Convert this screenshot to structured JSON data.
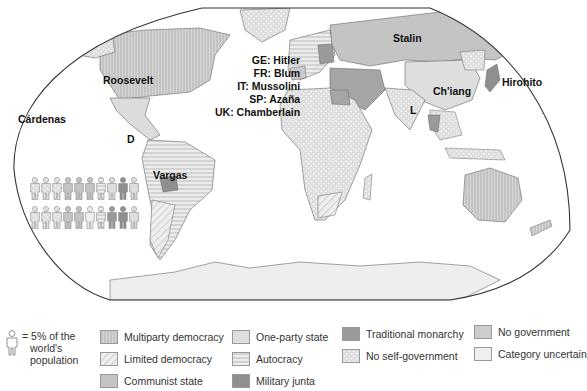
{
  "map": {
    "title": "World political systems (c. 1936)",
    "frame_shape": "robinson-like rounded projection",
    "leaders": [
      {
        "id": "us",
        "label": "Roosevelt",
        "x": 103,
        "y": 75
      },
      {
        "id": "mexico",
        "label": "Cárdenas",
        "x": 18,
        "y": 114
      },
      {
        "id": "mexico-abbr",
        "label": "D",
        "x": 128,
        "y": 116
      },
      {
        "id": "brazil",
        "label": "Vargas",
        "x": 153,
        "y": 170
      },
      {
        "id": "ussr",
        "label": "Stalin",
        "x": 393,
        "y": 33
      },
      {
        "id": "china",
        "label": "Ch'iang",
        "x": 433,
        "y": 86
      },
      {
        "id": "india",
        "label": "L",
        "x": 409,
        "y": 107
      },
      {
        "id": "japan",
        "label": "Hirohito",
        "x": 502,
        "y": 77
      }
    ],
    "europe_leaders": [
      "GE: Hitler",
      "FR: Blum",
      "IT: Mussolini",
      "SP: Azaña",
      "UK: Chamberlain"
    ]
  },
  "population_pictogram": {
    "unit_label": "= 5% of the world's population",
    "unit_lines": [
      "= 5% of the",
      "world's",
      "population"
    ],
    "rows": [
      [
        "no-self-government",
        "no-self-government",
        "no-self-government",
        "communist-state",
        "communist-state",
        "communist-state",
        "autocracy",
        "one-party-state",
        "military-junta",
        "one-party-state"
      ],
      [
        "no-self-government",
        "no-self-government",
        "no-self-government",
        "communist-state",
        "communist-state",
        "category-uncertain",
        "autocracy",
        "traditional-monarchy",
        "military-junta",
        "one-party-state"
      ]
    ]
  },
  "legend": {
    "items": [
      {
        "key": "multiparty-democracy",
        "label": "Multiparty democracy",
        "fill": "#d2d2d2",
        "pattern": "vertical-lines"
      },
      {
        "key": "limited-democracy",
        "label": "Limited democracy",
        "fill": "#ececec",
        "pattern": "diagonal-lines"
      },
      {
        "key": "communist-state",
        "label": "Communist state",
        "fill": "#c4c4c4",
        "pattern": "solid"
      },
      {
        "key": "one-party-state",
        "label": "One-party state",
        "fill": "#dedede",
        "pattern": "solid"
      },
      {
        "key": "autocracy",
        "label": "Autocracy",
        "fill": "#e6e6e6",
        "pattern": "horizontal-lines"
      },
      {
        "key": "military-junta",
        "label": "Military junta",
        "fill": "#8f8f8f",
        "pattern": "solid"
      },
      {
        "key": "traditional-monarchy",
        "label": "Traditional monarchy",
        "fill": "#9a9a9a",
        "pattern": "solid"
      },
      {
        "key": "no-self-government",
        "label": "No self-government",
        "fill": "#dcdcdc",
        "pattern": "dots"
      },
      {
        "key": "no-government",
        "label": "No government",
        "fill": "#cdcdcd",
        "pattern": "solid"
      },
      {
        "key": "category-uncertain",
        "label": "Category uncertain",
        "fill": "#efefef",
        "pattern": "solid"
      }
    ]
  }
}
